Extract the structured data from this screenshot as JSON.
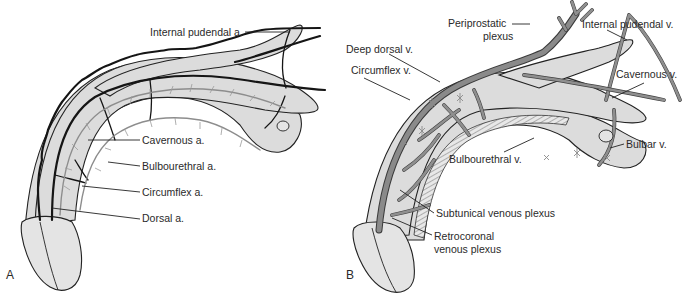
{
  "figure_a": {
    "panel_letter": "A",
    "title": "Arterial supply",
    "labels": [
      {
        "text": "Internal pudendal a.",
        "x": 150,
        "y": 26
      },
      {
        "text": "Cavernous a.",
        "x": 142,
        "y": 138
      },
      {
        "text": "Bulbourethral a.",
        "x": 142,
        "y": 160
      },
      {
        "text": "Circumflex a.",
        "x": 142,
        "y": 187
      },
      {
        "text": "Dorsal a.",
        "x": 142,
        "y": 213
      }
    ]
  },
  "figure_b": {
    "panel_letter": "B",
    "title": "Venous drainage",
    "labels": [
      {
        "text": "Periprostatic",
        "x": 104,
        "y": 22
      },
      {
        "text": "plexus",
        "x": 139,
        "y": 34
      },
      {
        "text": "Internal pudendal v.",
        "x": 238,
        "y": 23
      },
      {
        "text": "Deep dorsal v.",
        "x": 2,
        "y": 46
      },
      {
        "text": "Circumflex v.",
        "x": 7,
        "y": 67
      },
      {
        "text": "Cavernous v.",
        "x": 272,
        "y": 73
      },
      {
        "text": "Bulbar v.",
        "x": 282,
        "y": 140
      },
      {
        "text": "Bulbourethral v.",
        "x": 105,
        "y": 157
      },
      {
        "text": "Subtunical venous plexus",
        "x": 92,
        "y": 211
      },
      {
        "text": "Retrocoronal",
        "x": 90,
        "y": 234
      },
      {
        "text": "venous plexus",
        "x": 90,
        "y": 246
      }
    ]
  },
  "colors": {
    "tissue": "#dcdcdc",
    "artery": "#151515",
    "branch": "#8d8d8d",
    "vein": "#8a8a8a",
    "text": "#2a2a2a",
    "background": "#ffffff"
  }
}
